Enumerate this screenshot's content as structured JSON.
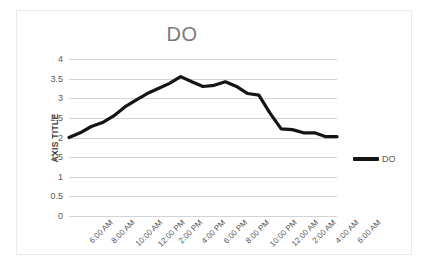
{
  "chart_data": {
    "type": "line",
    "title": "DO",
    "xlabel": "",
    "ylabel": "AXIS TITLE",
    "ylim": [
      0,
      4
    ],
    "ytick_values": [
      4,
      3.5,
      3,
      2.5,
      2,
      1.5,
      1,
      0.5,
      0
    ],
    "ytick_labels": [
      "4",
      "3.5",
      "3",
      "2.5",
      "2",
      "1.5",
      "1",
      "0.5",
      "0"
    ],
    "grid": true,
    "legend_position": "right",
    "legend": [
      "DO"
    ],
    "categories": [
      "6:00 AM",
      "",
      "8:00 AM",
      "",
      "10:00 AM",
      "",
      "12:00 PM",
      "",
      "2:00 PM",
      "",
      "4:00 PM",
      "",
      "6:00 PM",
      "",
      "8:00 PM",
      "",
      "10:00 PM",
      "",
      "12:00 AM",
      "",
      "2:00 AM",
      "",
      "4:00 AM",
      "",
      "6:00 AM"
    ],
    "xtick_labels": [
      "6:00 AM",
      "8:00 AM",
      "10:00 AM",
      "12:00 PM",
      "2:00 PM",
      "4:00 PM",
      "6:00 PM",
      "8:00 PM",
      "10:00 PM",
      "12:00 AM",
      "2:00 AM",
      "4:00 AM",
      "6:00 AM"
    ],
    "series": [
      {
        "name": "DO",
        "color": "#141414",
        "values": [
          2.0,
          2.12,
          2.28,
          2.38,
          2.55,
          2.78,
          2.95,
          3.12,
          3.25,
          3.38,
          3.55,
          3.42,
          3.3,
          3.33,
          3.42,
          3.3,
          3.12,
          3.08,
          2.62,
          2.22,
          2.2,
          2.12,
          2.12,
          2.02,
          2.02
        ]
      }
    ]
  }
}
